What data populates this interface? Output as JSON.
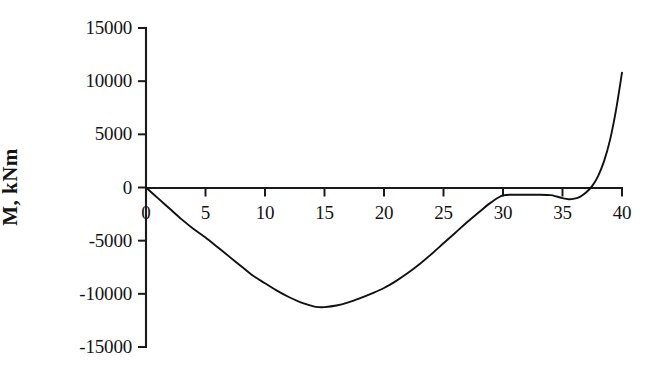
{
  "chart_data": {
    "type": "line",
    "title": "",
    "subtitle": "",
    "xlabel": "",
    "ylabel": "M, kNm",
    "xlim": [
      0,
      40
    ],
    "ylim": [
      -15000,
      15000
    ],
    "grid": false,
    "legend": null,
    "legend_position": "none",
    "x_ticks": [
      0,
      5,
      10,
      15,
      20,
      25,
      30,
      35,
      40
    ],
    "x_tick_labels": [
      "0",
      "5",
      "10",
      "15",
      "20",
      "25",
      "30",
      "35",
      "40"
    ],
    "y_ticks": [
      -15000,
      -10000,
      -5000,
      0,
      5000,
      10000,
      15000
    ],
    "y_tick_labels": [
      "-15000",
      "-10000",
      "-5000",
      "0",
      "5000",
      "10000",
      "15000"
    ],
    "series": [
      {
        "name": "Bending moment",
        "color": "#111111",
        "x": [
          0,
          1,
          2,
          3,
          4,
          5,
          6,
          7,
          8,
          9,
          10,
          11,
          12,
          13,
          14,
          14.5,
          15,
          16,
          17,
          18,
          19,
          20,
          21,
          22,
          23,
          24,
          25,
          26,
          27,
          28,
          29,
          30,
          31,
          32,
          33,
          34,
          34.5,
          35,
          35.5,
          36,
          36.5,
          37,
          37.5,
          38,
          38.5,
          39,
          39.5,
          40
        ],
        "values": [
          0,
          -1000,
          -2000,
          -3000,
          -3900,
          -4700,
          -5600,
          -6500,
          -7400,
          -8300,
          -9000,
          -9700,
          -10300,
          -10800,
          -11150,
          -11250,
          -11250,
          -11100,
          -10800,
          -10400,
          -9950,
          -9450,
          -8800,
          -8050,
          -7200,
          -6250,
          -5250,
          -4250,
          -3250,
          -2300,
          -1400,
          -750,
          -680,
          -680,
          -680,
          -720,
          -850,
          -1000,
          -1100,
          -1050,
          -850,
          -450,
          150,
          1100,
          2500,
          4500,
          7300,
          10800
        ]
      }
    ],
    "annotations": []
  },
  "axes": {
    "y_axis_title": "M, kNm",
    "x_axis_title": ""
  },
  "icons": {
    "curve": "line-curve-icon"
  },
  "colors": {
    "background": "#ffffff",
    "axis": "#1a1a1a",
    "curve": "#111111",
    "text": "#141414"
  }
}
